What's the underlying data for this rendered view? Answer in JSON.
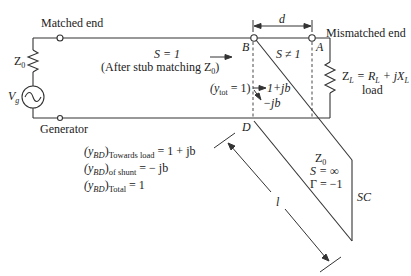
{
  "labels": {
    "matched_end": "Matched end",
    "generator": "Generator",
    "mismatched_end": "Mismatched end",
    "source_impedance": "Z",
    "source_impedance_sub": "0",
    "source_voltage": "V",
    "source_voltage_sub": "g",
    "swr_matched": "S = 1",
    "after_stub": "(After stub matching Z",
    "after_stub_sub": "0",
    "after_stub_close": ")",
    "point_b": "B",
    "point_a": "A",
    "point_d": "D",
    "distance_d": "d",
    "swr_mismatched": "S ≠ 1",
    "load_equation": "Z",
    "load_equation_sub": "L",
    "load_rhs": "= R",
    "load_rhs_sub": "L",
    "load_rhs2": " + jX",
    "load_rhs2_sub": "L",
    "load_word": "load",
    "y_tot": "(y",
    "y_tot_sub": "tot",
    "y_tot_rhs": " = 1)",
    "arrow_toward_load": "1+jb",
    "arrow_shunt": "−jb",
    "stub_z0": "Z",
    "stub_z0_sub": "0",
    "stub_swr": "S = ∞",
    "stub_gamma": "Γ = −1",
    "stub_end": "SC",
    "stub_length": "l"
  },
  "equations": [
    {
      "lhs": "(y",
      "lhs_sub": "BD",
      "close": ")",
      "qualifier": "Towards load",
      "rhs": "= 1 + jb"
    },
    {
      "lhs": "(y",
      "lhs_sub": "BD",
      "close": ")",
      "qualifier": "of shunt",
      "rhs": "= − jb"
    },
    {
      "lhs": "(y",
      "lhs_sub": "BD",
      "close": ")",
      "qualifier": "Total",
      "rhs": "= 1"
    }
  ],
  "colors": {
    "line": "#333333",
    "text": "#222222"
  }
}
